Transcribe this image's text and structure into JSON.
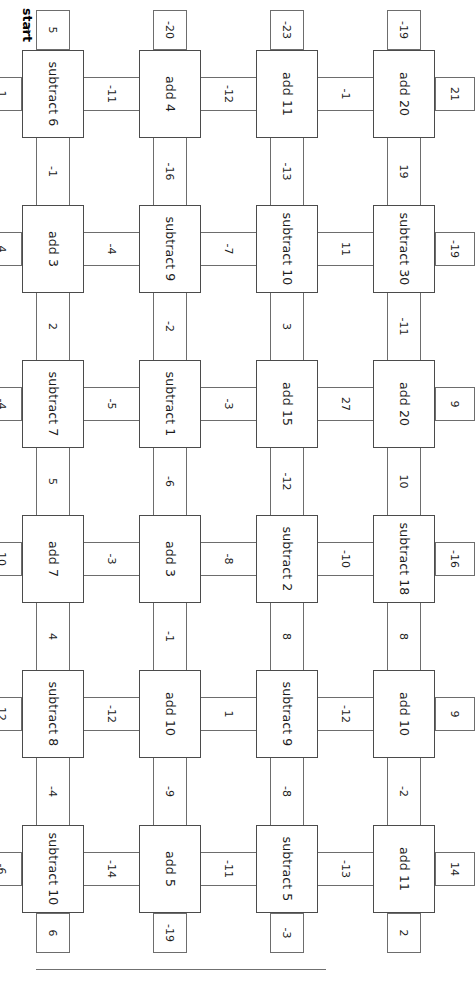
{
  "diagram": {
    "start": {
      "label": "start",
      "value": "5",
      "arrow": "→"
    },
    "orientation_deg": 90,
    "rows": 6,
    "cols": 4,
    "nodes": [
      [
        "add 20",
        "add 11",
        "add 4",
        "subtract 6"
      ],
      [
        "subtract 30",
        "subtract 10",
        "subtract 9",
        "add 3"
      ],
      [
        "add 20",
        "add 15",
        "subtract 1",
        "subtract 7"
      ],
      [
        "subtract 18",
        "subtract 2",
        "add 3",
        "add 7"
      ],
      [
        "add 10",
        "subtract 9",
        "add 10",
        "subtract 8"
      ],
      [
        "add 11",
        "subtract 5",
        "add 5",
        "subtract 10"
      ]
    ],
    "horizontal_edges": [
      [
        "21",
        "-1",
        "-12",
        "-11",
        "1"
      ],
      [
        "-19",
        "11",
        "-7",
        "-4",
        "4"
      ],
      [
        "9",
        "27",
        "-3",
        "-5",
        "-4"
      ],
      [
        "-16",
        "-10",
        "-8",
        "-3",
        "10"
      ],
      [
        "9",
        "-12",
        "1",
        "-12",
        "12"
      ],
      [
        "14",
        "-13",
        "-11",
        "-14",
        "-6"
      ]
    ],
    "vertical_edges": [
      [
        "-19",
        "-23",
        "-20",
        "5"
      ],
      [
        "19",
        "-13",
        "-16",
        "-1"
      ],
      [
        "-11",
        "3",
        "-2",
        "2"
      ],
      [
        "10",
        "-12",
        "-6",
        "5"
      ],
      [
        "8",
        "8",
        "-1",
        "4"
      ],
      [
        "-2",
        "-8",
        "-9",
        "-4"
      ],
      [
        "2",
        "-3",
        "-19",
        "6"
      ]
    ]
  }
}
